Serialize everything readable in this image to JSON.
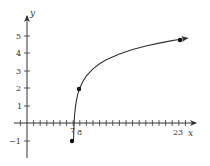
{
  "chart_data": {
    "type": "line",
    "title": "",
    "xlabel": "x",
    "ylabel": "y",
    "xlim": [
      -1,
      24
    ],
    "ylim": [
      -2,
      5.8
    ],
    "grid": false,
    "legend": null,
    "x_tick_labels": [
      "7",
      "8",
      "23"
    ],
    "y_tick_labels": [
      "-1",
      "1",
      "2",
      "3",
      "4",
      "5"
    ],
    "series": [
      {
        "name": "curve",
        "x": [
          7,
          8,
          23
        ],
        "y": [
          -1,
          2,
          4.8
        ],
        "marked_points": [
          {
            "x": 7,
            "y": -1
          },
          {
            "x": 8,
            "y": 2
          },
          {
            "x": 23,
            "y": 4.8
          }
        ],
        "arrow_end": true
      }
    ]
  },
  "axes": {
    "x_label": "x",
    "y_label": "y",
    "x_ticks": {
      "label_7": "7",
      "label_8": "8",
      "label_23": "23"
    },
    "y_ticks": {
      "label_neg1": "−1",
      "label_1": "1",
      "label_2": "2",
      "label_3": "3",
      "label_4": "4",
      "label_5": "5"
    }
  }
}
